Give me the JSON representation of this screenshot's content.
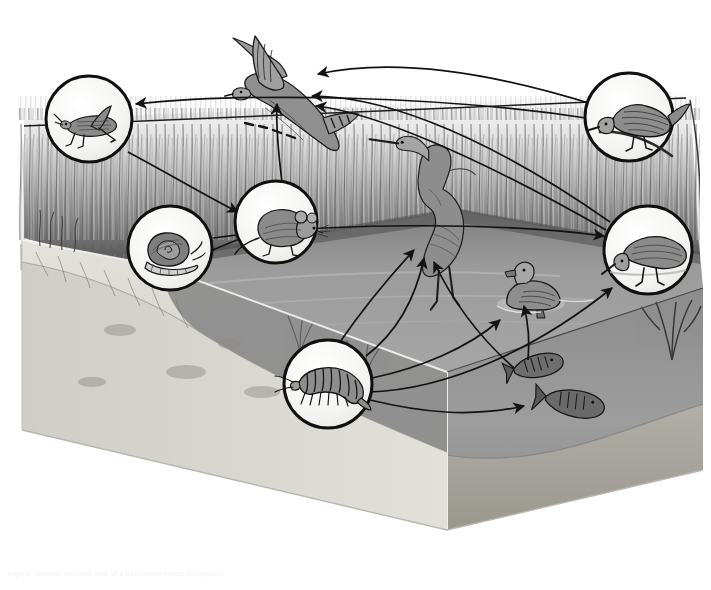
{
  "figure": {
    "medium": "grayscale pen-and-ink scientific illustration",
    "view": "three-dimensional block cross-section of a marsh pond with cut-away bank and underwater view",
    "background_color": "#ffffff",
    "caption": "Figure. Generalized food web of a freshwater marsh ecosystem."
  },
  "palette": {
    "paper": "#ffffff",
    "ink": "#141414",
    "water_surface": "#9a9a9a",
    "water_surface_far": "#8d8d8d",
    "water_deep": "#8f8f8f",
    "water_cut_face": "#9c9c9c",
    "soil_bank": "#d9d7d2",
    "soil_bank_shadow": "#bdbab4",
    "sediment": "#a8a5a0",
    "reeds_dark": "#555555",
    "reeds_light": "#c9c9c9",
    "callout_fill": "#f4f4f2",
    "callout_stroke": "#111111"
  },
  "scene": {
    "habitat_zones": [
      {
        "name": "emergent-reed-bed",
        "label": "Reeds and emergent marsh vegetation",
        "position": "upper band across the full width"
      },
      {
        "name": "open-water-surface",
        "label": "Open water surface of the pond",
        "position": "middle of the block"
      },
      {
        "name": "cut-away-water-column",
        "label": "Water column shown in cross-section",
        "position": "front-right cut face"
      },
      {
        "name": "bank-and-sediment",
        "label": "Sloping bank and pond sediment",
        "position": "front-left cut face"
      }
    ]
  },
  "organisms": [
    {
      "id": "grasshopper",
      "label": "Grasshopper",
      "role": "Primary consumer (herbivorous insect)",
      "in_callout": true,
      "callout": {
        "cx": 89,
        "cy": 119,
        "r": 43
      },
      "glyph": "grasshopper-icon"
    },
    {
      "id": "snail",
      "label": "Snail",
      "role": "Primary consumer (grazer)",
      "in_callout": true,
      "callout": {
        "cx": 170,
        "cy": 248,
        "r": 42
      },
      "glyph": "snail-icon"
    },
    {
      "id": "mouse",
      "label": "Marsh mouse / vole",
      "role": "Secondary consumer (small mammal)",
      "in_callout": true,
      "callout": {
        "cx": 276,
        "cy": 222,
        "r": 41
      },
      "glyph": "mouse-icon"
    },
    {
      "id": "amphipod",
      "label": "Amphipod (scud)",
      "role": "Aquatic invertebrate detritivore",
      "in_callout": true,
      "callout": {
        "cx": 328,
        "cy": 384,
        "r": 44
      },
      "glyph": "amphipod-icon"
    },
    {
      "id": "sandpiper",
      "label": "Sandpiper (wading shorebird)",
      "role": "Secondary consumer (probes sediment)",
      "in_callout": true,
      "callout": {
        "cx": 648,
        "cy": 250,
        "r": 44
      },
      "glyph": "sandpiper-icon"
    },
    {
      "id": "songbird",
      "label": "Marsh songbird (wren / sparrow)",
      "role": "Secondary consumer (insectivore)",
      "in_callout": true,
      "callout": {
        "cx": 629,
        "cy": 117,
        "r": 44
      },
      "glyph": "songbird-icon"
    },
    {
      "id": "hawk",
      "label": "Marsh hawk / harrier in flight",
      "role": "Top predator (apex consumer)",
      "in_callout": false,
      "position": {
        "x": 268,
        "y": 72
      },
      "glyph": "hawk-icon"
    },
    {
      "id": "heron",
      "label": "Heron / egret wading",
      "role": "Top predator of the shallows",
      "in_callout": false,
      "position": {
        "x": 420,
        "y": 196
      },
      "glyph": "heron-icon"
    },
    {
      "id": "duck",
      "label": "Duck (dabbling waterfowl)",
      "role": "Omnivore of the open water",
      "in_callout": false,
      "position": {
        "x": 525,
        "y": 297
      },
      "glyph": "duck-icon"
    },
    {
      "id": "fish",
      "label": "Fish (minnows)",
      "role": "Aquatic consumer in the water column",
      "in_callout": false,
      "position": {
        "x": 545,
        "y": 382
      },
      "glyph": "fish-icon"
    }
  ],
  "food_web_links": [
    {
      "from": "grasshopper",
      "to": "mouse",
      "meaning": "eaten by"
    },
    {
      "from": "snail",
      "to": "mouse",
      "meaning": "eaten by"
    },
    {
      "from": "grasshopper",
      "to": "songbird",
      "meaning": "eaten by"
    },
    {
      "from": "snail",
      "to": "sandpiper",
      "meaning": "eaten by"
    },
    {
      "from": "mouse",
      "to": "hawk",
      "meaning": "eaten by"
    },
    {
      "from": "songbird",
      "to": "hawk",
      "meaning": "eaten by"
    },
    {
      "from": "sandpiper",
      "to": "hawk",
      "meaning": "eaten by"
    },
    {
      "from": "duck",
      "to": "hawk",
      "meaning": "eaten by"
    },
    {
      "from": "amphipod",
      "to": "heron",
      "meaning": "eaten by"
    },
    {
      "from": "amphipod",
      "to": "duck",
      "meaning": "eaten by"
    },
    {
      "from": "amphipod",
      "to": "fish",
      "meaning": "eaten by"
    },
    {
      "from": "amphipod",
      "to": "sandpiper",
      "meaning": "eaten by"
    },
    {
      "from": "fish",
      "to": "heron",
      "meaning": "eaten by"
    },
    {
      "from": "fish",
      "to": "duck",
      "meaning": "eaten by"
    }
  ],
  "legend": {
    "arrow_meaning": "Arrows point from prey to predator, showing the direction of energy flow.",
    "callout_meaning": "Circles magnify small organisms that are too small to show at scene scale."
  }
}
